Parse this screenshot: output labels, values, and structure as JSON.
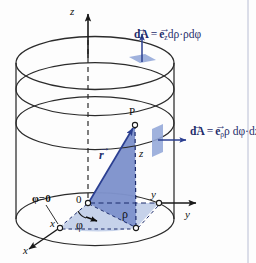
{
  "figure": {
    "background_color": "#fdfdfd",
    "outline_color": "#2b2b2b",
    "accent_color": "#1f2d6b",
    "triangle_fill": "#7f93cc",
    "sector_fill": "#c3d0e9",
    "patch_fill": "#93a7d8"
  },
  "axes": {
    "z_label": "z",
    "y_label": "y",
    "x_label": "x",
    "origin_label": "0"
  },
  "points": {
    "p_label": "P",
    "x_foot_label": "x",
    "y_foot_label": "y"
  },
  "vectors": {
    "r_label": "r",
    "r_arrow": "→"
  },
  "coords": {
    "rho_label": "ρ",
    "phi_label": "φ",
    "z_height_label": "z",
    "phi_zero_label": "φ=0"
  },
  "formulas": {
    "top": {
      "id": "dA-z-formula",
      "dA_symbol": "dA",
      "dA_arrow": "→",
      "equals": "=",
      "e_symbol": "e",
      "e_arrow": "→",
      "e_subscript": "z",
      "rest": "dρ·ρdφ",
      "plain": "dA⃗ = e⃗_z dρ·ρdφ"
    },
    "side": {
      "id": "dA-rho-formula",
      "dA_symbol": "dA",
      "dA_arrow": "→",
      "equals": "=",
      "e_symbol": "e",
      "e_arrow": "→",
      "e_subscript": "ρ",
      "rest": "ρ dφ·dz",
      "plain": "dA⃗ = e⃗_ρ ρ dφ·dz"
    }
  }
}
